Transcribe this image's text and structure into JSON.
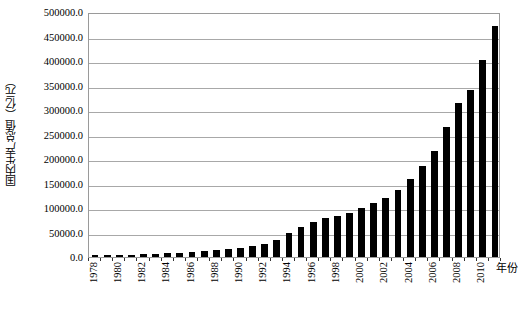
{
  "chart_data": {
    "type": "bar",
    "title": "",
    "subtitle": "",
    "xlabel": "年份",
    "ylabel": "国内生产总值（亿元）",
    "grid": true,
    "legend": false,
    "legend_position": "none",
    "xlim": [
      1977.5,
      2011.5
    ],
    "ylim": [
      0,
      500000
    ],
    "ytick_labels": [
      "500000.0",
      "450000.0",
      "400000.0",
      "350000.0",
      "300000.0",
      "250000.0",
      "200000.0",
      "150000.0",
      "100000.0",
      "50000.0",
      "0.0"
    ],
    "ytick_values": [
      500000,
      450000,
      400000,
      350000,
      300000,
      250000,
      200000,
      150000,
      100000,
      50000,
      0
    ],
    "xtick_labels": [
      "1978",
      "1980",
      "1982",
      "1984",
      "1986",
      "1988",
      "1990",
      "1992",
      "1994",
      "1996",
      "1998",
      "2000",
      "2002",
      "2004",
      "2006",
      "2008",
      "2010"
    ],
    "categories": [
      "1978",
      "1979",
      "1980",
      "1981",
      "1982",
      "1983",
      "1984",
      "1985",
      "1986",
      "1987",
      "1988",
      "1989",
      "1990",
      "1991",
      "1992",
      "1993",
      "1994",
      "1995",
      "1996",
      "1997",
      "1998",
      "1999",
      "2000",
      "2001",
      "2002",
      "2003",
      "2004",
      "2005",
      "2006",
      "2007",
      "2008",
      "2009",
      "2010",
      "2011"
    ],
    "values": [
      3645,
      4063,
      4546,
      4892,
      5323,
      5963,
      7208,
      9016,
      10275,
      12059,
      15043,
      16992,
      18668,
      21782,
      26923,
      35334,
      48198,
      60794,
      71177,
      78973,
      84402,
      89677,
      99215,
      109655,
      120333,
      135823,
      159878,
      184937,
      216314,
      265810,
      314045,
      340903,
      401513,
      471564
    ],
    "bar_color": "#000000",
    "axis_color": "#9a9a9a",
    "gridline_color": "#a8a8a8",
    "background_color": "#ffffff"
  }
}
